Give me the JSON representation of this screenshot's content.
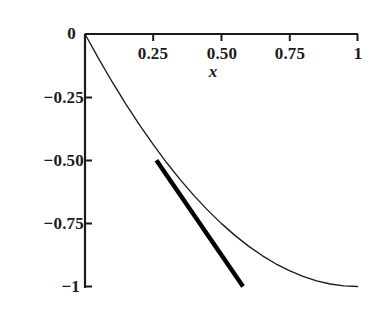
{
  "figure": {
    "background_color": "#ffffff",
    "ink_color": "#1b1b1b"
  },
  "chart_data": {
    "type": "line",
    "title": "",
    "subtitle": "",
    "xlabel": "x",
    "ylabel": "",
    "xlim": [
      0,
      1
    ],
    "ylim": [
      -1,
      0
    ],
    "grid": false,
    "legend": "none",
    "axis_style": "x-axis drawn along top at y=0, y-axis drawn at left at x=0, ticks point inward",
    "x_ticks": [
      0.25,
      0.5,
      0.75,
      1
    ],
    "x_tick_labels": [
      "0.25",
      "0.50",
      "0.75",
      "1"
    ],
    "y_ticks": [
      0,
      -0.25,
      -0.5,
      -0.75,
      -1
    ],
    "y_tick_labels": [
      "0",
      "−0.25",
      "−0.50",
      "−0.75",
      "−1"
    ],
    "series": [
      {
        "name": "curve",
        "style": "thin solid black line",
        "line_width": 1,
        "x": [
          0,
          0.05,
          0.1,
          0.15,
          0.2,
          0.25,
          0.3,
          0.35,
          0.4,
          0.45,
          0.5,
          0.55,
          0.6,
          0.65,
          0.7,
          0.75,
          0.8,
          0.85,
          0.9,
          0.95,
          1
        ],
        "values": [
          0,
          -0.0975,
          -0.19,
          -0.2775,
          -0.36,
          -0.4375,
          -0.51,
          -0.5775,
          -0.64,
          -0.6975,
          -0.75,
          -0.7975,
          -0.84,
          -0.8775,
          -0.91,
          -0.9375,
          -0.96,
          -0.9775,
          -0.99,
          -0.9975,
          -1
        ]
      },
      {
        "name": "tangent-line",
        "style": "thick solid black straight segment tangent to the curve near x = 0.5",
        "line_width": 4,
        "x": [
          0.262,
          0.58
        ],
        "values": [
          -0.5,
          -1.0
        ],
        "tangent_point": [
          0.5,
          -0.75
        ],
        "slope": -1.0
      }
    ],
    "annotations": []
  },
  "axis_labels": {
    "x_label": "x",
    "x_ticks": [
      "0.25",
      "0.50",
      "0.75",
      "1"
    ],
    "y_ticks": [
      "0",
      "−0.25",
      "−0.50",
      "−0.75",
      "−1"
    ]
  }
}
